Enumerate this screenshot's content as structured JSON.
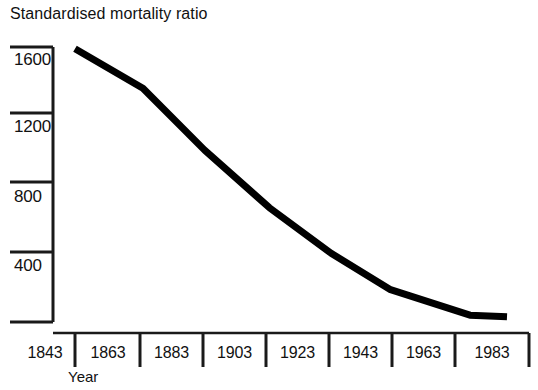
{
  "chart_data": {
    "type": "line",
    "title": "Standardised mortality ratio",
    "xlabel": "Year",
    "ylabel": "",
    "grid": false,
    "legend": false,
    "ylim": [
      0,
      1800
    ],
    "xlim": [
      1843,
      1983
    ],
    "ytick_labels": [
      "1600",
      "1200",
      "800",
      "400"
    ],
    "ytick_values": [
      1600,
      1200,
      800,
      400
    ],
    "xtick_labels": [
      "1843",
      "1863",
      "1883",
      "1903",
      "1923",
      "1943",
      "1963",
      "1983"
    ],
    "xtick_values": [
      1843,
      1863,
      1883,
      1903,
      1923,
      1943,
      1963,
      1983
    ],
    "series": [
      {
        "name": "Standardised mortality ratio",
        "color": "#000000",
        "x": [
          1843,
          1865,
          1885,
          1906,
          1926,
          1945,
          1971,
          1983
        ],
        "values": [
          1590,
          1360,
          1000,
          665,
          400,
          190,
          40,
          30
        ]
      }
    ]
  },
  "line_color": "#000000",
  "axis_color": "#1a1a1a"
}
